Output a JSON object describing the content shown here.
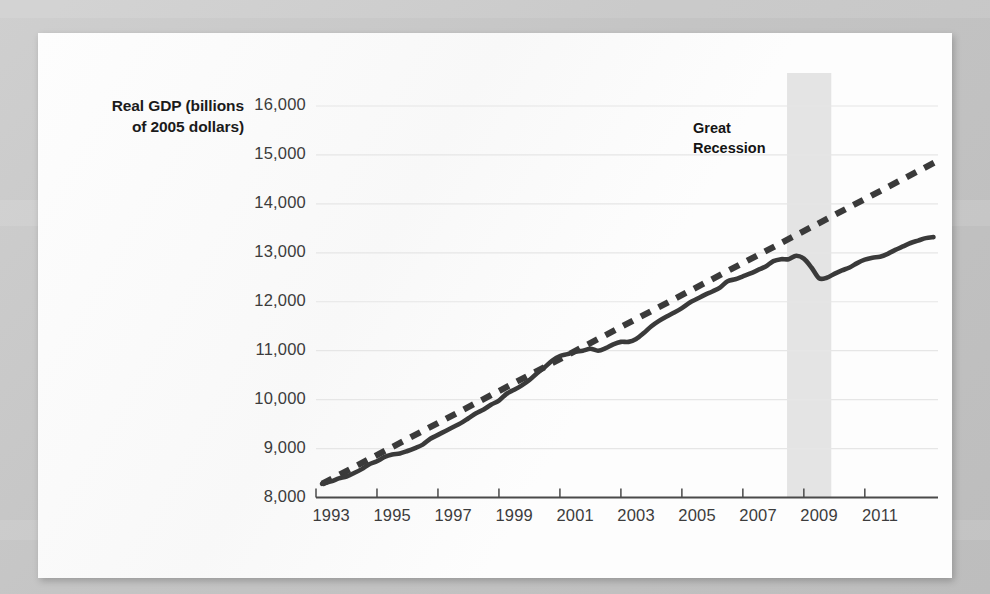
{
  "figure": {
    "y_axis_title_line1": "Real GDP (billions",
    "y_axis_title_line2": "of 2005 dollars)",
    "annotation_line1": "Great",
    "annotation_line2": "Recession"
  },
  "colors": {
    "page_background": "#fdfdfd",
    "outer_background": "#c9c9c9",
    "line": "#3a3a3a",
    "trend_line": "#3a3a3a",
    "gridline": "#e6e6e6",
    "axis": "#4a4a4a",
    "recession_band": "#e4e4e4",
    "tick_text": "#3c3c3c",
    "label_text": "#1b1b1b"
  },
  "chart_data": {
    "type": "line",
    "title": "",
    "subtitle": "",
    "xlabel": "",
    "ylabel": "Real GDP (billions of 2005 dollars)",
    "xlim": [
      1992.5,
      2012.9
    ],
    "ylim": [
      8000,
      16000
    ],
    "grid": true,
    "legend": "none",
    "y_ticks": [
      8000,
      9000,
      10000,
      11000,
      12000,
      13000,
      14000,
      15000,
      16000
    ],
    "y_tick_labels": [
      "8,000",
      "9,000",
      "10,000",
      "11,000",
      "12,000",
      "13,000",
      "14,000",
      "15,000",
      "16,000"
    ],
    "x_ticks": [
      1993,
      1995,
      1997,
      1999,
      2001,
      2003,
      2005,
      2007,
      2009,
      2011
    ],
    "x_tick_labels": [
      "1993",
      "1995",
      "1997",
      "1999",
      "2001",
      "2003",
      "2005",
      "2007",
      "2009",
      "2011"
    ],
    "annotations": [
      {
        "text": "Great Recession",
        "x": 2007.0,
        "y": 15150,
        "kind": "label"
      }
    ],
    "shaded_regions": [
      {
        "name": "Great Recession",
        "x_start": 2007.95,
        "x_end": 2009.4,
        "color": "#e4e4e4"
      }
    ],
    "series": [
      {
        "name": "Real GDP",
        "style": "solid",
        "color": "#3a3a3a",
        "x": [
          1992.7,
          1993.0,
          1993.25,
          1993.5,
          1993.75,
          1994.0,
          1994.25,
          1994.5,
          1994.75,
          1995.0,
          1995.25,
          1995.5,
          1995.75,
          1996.0,
          1996.25,
          1996.5,
          1996.75,
          1997.0,
          1997.25,
          1997.5,
          1997.75,
          1998.0,
          1998.25,
          1998.5,
          1998.75,
          1999.0,
          1999.25,
          1999.5,
          1999.75,
          2000.0,
          2000.25,
          2000.5,
          2000.75,
          2001.0,
          2001.25,
          2001.5,
          2001.75,
          2002.0,
          2002.25,
          2002.5,
          2002.75,
          2003.0,
          2003.25,
          2003.5,
          2003.75,
          2004.0,
          2004.25,
          2004.5,
          2004.75,
          2005.0,
          2005.25,
          2005.5,
          2005.75,
          2006.0,
          2006.25,
          2006.5,
          2006.75,
          2007.0,
          2007.25,
          2007.5,
          2007.75,
          2008.0,
          2008.25,
          2008.5,
          2008.75,
          2009.0,
          2009.25,
          2009.5,
          2009.75,
          2010.0,
          2010.25,
          2010.5,
          2010.75,
          2011.0,
          2011.25,
          2011.5,
          2011.75,
          2012.0,
          2012.25,
          2012.5,
          2012.75
        ],
        "y": [
          8280,
          8330,
          8390,
          8430,
          8500,
          8580,
          8680,
          8740,
          8830,
          8880,
          8900,
          8950,
          9010,
          9080,
          9200,
          9280,
          9360,
          9440,
          9520,
          9620,
          9720,
          9800,
          9900,
          9980,
          10120,
          10200,
          10290,
          10400,
          10540,
          10660,
          10800,
          10890,
          10930,
          10980,
          11000,
          11040,
          11000,
          11050,
          11130,
          11180,
          11180,
          11240,
          11360,
          11500,
          11610,
          11700,
          11780,
          11870,
          11980,
          12060,
          12140,
          12210,
          12290,
          12420,
          12460,
          12520,
          12580,
          12650,
          12720,
          12830,
          12870,
          12870,
          12940,
          12880,
          12700,
          12480,
          12490,
          12570,
          12640,
          12700,
          12790,
          12860,
          12900,
          12920,
          12980,
          13060,
          13130,
          13200,
          13250,
          13300,
          13320
        ],
        "note": "Actual real GDP"
      },
      {
        "name": "Potential / trend GDP",
        "style": "dashed",
        "color": "#3a3a3a",
        "x": [
          1992.7,
          2012.8
        ],
        "y": [
          8280,
          14850
        ],
        "note": "Long-run trend line"
      }
    ]
  }
}
